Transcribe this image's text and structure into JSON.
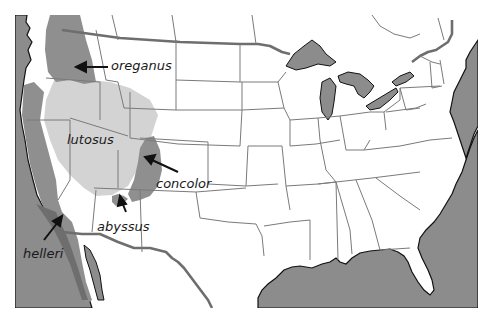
{
  "map": {
    "type": "range-map",
    "region": "United States (contiguous) with parts of Canada and Mexico",
    "colors": {
      "water": "#8c8c8c",
      "land": "#ffffff",
      "state_border": "#7a7a7a",
      "country_border": "#6e6e6e",
      "coastline": "#111111",
      "range_dark": "#8f8f8f",
      "range_light": "#d3d3d3",
      "arrow": "#111111"
    },
    "labels": [
      {
        "id": "oreganus",
        "text": "oreganus"
      },
      {
        "id": "lutosus",
        "text": "lutosus"
      },
      {
        "id": "concolor",
        "text": "concolor"
      },
      {
        "id": "abyssus",
        "text": "abyssus"
      },
      {
        "id": "helleri",
        "text": "helleri"
      }
    ],
    "legend": [
      {
        "shade": "dark",
        "subspecies": [
          "oreganus",
          "concolor",
          "helleri",
          "abyssus"
        ]
      },
      {
        "shade": "light",
        "subspecies": [
          "lutosus"
        ]
      }
    ]
  }
}
